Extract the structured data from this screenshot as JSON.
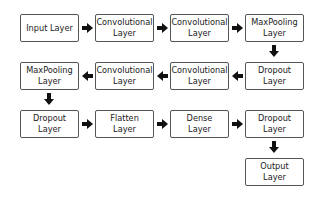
{
  "nodes": [
    {
      "id": "n1",
      "lines": [
        "Input Layer"
      ],
      "x": 20,
      "y": 14
    },
    {
      "id": "n2",
      "lines": [
        "Convolutional",
        "Layer"
      ],
      "x": 95,
      "y": 14
    },
    {
      "id": "n3",
      "lines": [
        "Convolutional",
        "Layer"
      ],
      "x": 170,
      "y": 14
    },
    {
      "id": "n4",
      "lines": [
        "MaxPooling",
        "Layer"
      ],
      "x": 245,
      "y": 14
    },
    {
      "id": "n5",
      "lines": [
        "Dropout",
        "Layer"
      ],
      "x": 245,
      "y": 62
    },
    {
      "id": "n6",
      "lines": [
        "Convolutional",
        "Layer"
      ],
      "x": 170,
      "y": 62
    },
    {
      "id": "n7",
      "lines": [
        "Convolutional",
        "Layer"
      ],
      "x": 95,
      "y": 62
    },
    {
      "id": "n8",
      "lines": [
        "MaxPooling",
        "Layer"
      ],
      "x": 20,
      "y": 62
    },
    {
      "id": "n9",
      "lines": [
        "Dropout",
        "Layer"
      ],
      "x": 20,
      "y": 110
    },
    {
      "id": "n10",
      "lines": [
        "Flatten",
        "Layer"
      ],
      "x": 95,
      "y": 110
    },
    {
      "id": "n11",
      "lines": [
        "Dense",
        "Layer"
      ],
      "x": 170,
      "y": 110
    },
    {
      "id": "n12",
      "lines": [
        "Dropout",
        "Layer"
      ],
      "x": 245,
      "y": 110
    },
    {
      "id": "n13",
      "lines": [
        "Output",
        "Layer"
      ],
      "x": 245,
      "y": 158
    }
  ],
  "edges": [
    {
      "from": "n1",
      "to": "n2",
      "dir": "right"
    },
    {
      "from": "n2",
      "to": "n3",
      "dir": "right"
    },
    {
      "from": "n3",
      "to": "n4",
      "dir": "right"
    },
    {
      "from": "n4",
      "to": "n5",
      "dir": "down"
    },
    {
      "from": "n5",
      "to": "n6",
      "dir": "left"
    },
    {
      "from": "n6",
      "to": "n7",
      "dir": "left"
    },
    {
      "from": "n7",
      "to": "n8",
      "dir": "left"
    },
    {
      "from": "n8",
      "to": "n9",
      "dir": "down"
    },
    {
      "from": "n9",
      "to": "n10",
      "dir": "right"
    },
    {
      "from": "n10",
      "to": "n11",
      "dir": "right"
    },
    {
      "from": "n11",
      "to": "n12",
      "dir": "right"
    },
    {
      "from": "n12",
      "to": "n13",
      "dir": "down"
    }
  ],
  "colors": {
    "border": "#555555",
    "arrow": "#111111",
    "text": "#222222",
    "background": "#ffffff"
  }
}
